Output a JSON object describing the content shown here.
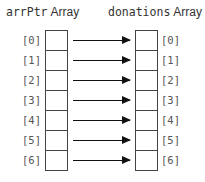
{
  "left_array": {
    "title_mono": "arrPtr",
    "title_sans": "Array",
    "indices": [
      "[0]",
      "[1]",
      "[2]",
      "[3]",
      "[4]",
      "[5]",
      "[6]"
    ]
  },
  "right_array": {
    "title_mono": "donations",
    "title_sans": "Array",
    "indices": [
      "[0]",
      "[1]",
      "[2]",
      "[3]",
      "[4]",
      "[5]",
      "[6]"
    ]
  },
  "colors": {
    "box_border": "#444444",
    "arrow": "#111111",
    "label": "#555555"
  }
}
